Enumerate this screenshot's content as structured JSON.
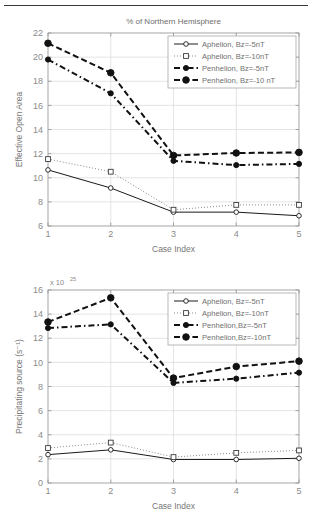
{
  "page": {
    "divider": "horizontal-rule"
  },
  "chart_data": [
    {
      "id": "effective-open-area",
      "type": "line",
      "title": "% of Northern Hemisphere",
      "xlabel": "Case Index",
      "ylabel": "Effective Open Area",
      "x": [
        1,
        2,
        3,
        4,
        5
      ],
      "xticks": [
        "1",
        "2",
        "3",
        "4",
        "5"
      ],
      "yticks": [
        "6",
        "8",
        "10",
        "12",
        "14",
        "16",
        "18",
        "20",
        "22"
      ],
      "xlim": [
        1,
        5
      ],
      "ylim": [
        6,
        22
      ],
      "grid": true,
      "legend_position": "top-right",
      "series": [
        {
          "name": "Aphelion, Bz=-5nT",
          "style": "solid",
          "marker": "circle-open",
          "values": [
            10.65,
            9.15,
            7.15,
            7.15,
            6.85
          ]
        },
        {
          "name": "Aphelion, Bz=-10nT",
          "style": "dotted",
          "marker": "square-open",
          "values": [
            11.55,
            10.5,
            7.35,
            7.75,
            7.75
          ]
        },
        {
          "name": "Penhelion, Bz=-5nT",
          "style": "dash-dot",
          "marker": "circle-filled",
          "values": [
            19.8,
            17.0,
            11.4,
            11.05,
            11.15
          ]
        },
        {
          "name": "Penhelion, Bz=-10 nT",
          "style": "dashed",
          "marker": "circle-filled-large",
          "values": [
            21.15,
            18.7,
            11.85,
            12.05,
            12.1
          ]
        }
      ]
    },
    {
      "id": "precipitating-source",
      "type": "line",
      "title": "",
      "xlabel": "Case Index",
      "ylabel": "Precipitating source (s⁻¹)",
      "exponent_label": "x 10",
      "exponent_value": "25",
      "x": [
        1,
        2,
        3,
        4,
        5
      ],
      "xticks": [
        "1",
        "2",
        "3",
        "4",
        "5"
      ],
      "yticks": [
        "0",
        "2",
        "4",
        "6",
        "8",
        "10",
        "12",
        "14",
        "16"
      ],
      "xlim": [
        1,
        5
      ],
      "ylim": [
        0,
        16
      ],
      "grid": true,
      "legend_position": "top-right",
      "series": [
        {
          "name": "Aphelion, Bz=-5nT",
          "style": "solid",
          "marker": "circle-open",
          "values": [
            2.35,
            2.75,
            1.95,
            1.95,
            2.05
          ]
        },
        {
          "name": "Aphelion, Bz=-10nT",
          "style": "dotted",
          "marker": "square-open",
          "values": [
            2.9,
            3.35,
            2.15,
            2.5,
            2.7
          ]
        },
        {
          "name": "Penhelion,Bz=-5nT",
          "style": "dash-dot",
          "marker": "circle-filled",
          "values": [
            12.85,
            13.15,
            8.3,
            8.65,
            9.15
          ]
        },
        {
          "name": "Penhelion,Bz=-10nT",
          "style": "dashed",
          "marker": "circle-filled-large",
          "values": [
            13.35,
            15.35,
            8.7,
            9.65,
            10.1
          ]
        }
      ]
    }
  ]
}
